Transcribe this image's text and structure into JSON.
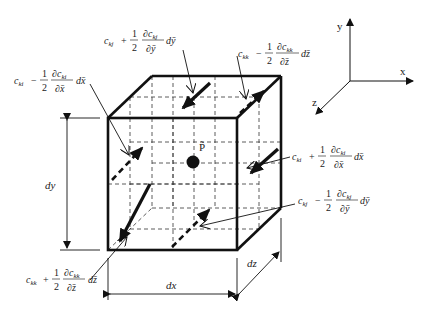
{
  "diagram": {
    "type": "control-volume-cube",
    "center_point": {
      "label": "P̃"
    },
    "axes": {
      "x": "x",
      "y": "y",
      "z": "z"
    },
    "dimensions": {
      "dx": "dx",
      "dy": "dy",
      "dz": "dz"
    },
    "flux_labels": [
      {
        "id": "top",
        "base": "c",
        "sub": "kj",
        "sign": "+",
        "half": "1",
        "den": "2",
        "dnum": "∂c",
        "dnum_sub": "kj",
        "dden": "∂ȳ",
        "diff": "dȳ"
      },
      {
        "id": "back",
        "base": "c",
        "sub": "kk",
        "sign": "−",
        "half": "1",
        "den": "2",
        "dnum": "∂c",
        "dnum_sub": "kk",
        "dden": "∂z̄",
        "diff": "dz̄"
      },
      {
        "id": "left",
        "base": "c",
        "sub": "ki",
        "sign": "−",
        "half": "1",
        "den": "2",
        "dnum": "∂c",
        "dnum_sub": "ki",
        "dden": "∂x̄",
        "diff": "dx̄"
      },
      {
        "id": "right",
        "base": "c",
        "sub": "ki",
        "sign": "+",
        "half": "1",
        "den": "2",
        "dnum": "∂c",
        "dnum_sub": "ki",
        "dden": "∂x̄",
        "diff": "dx̄"
      },
      {
        "id": "bottom",
        "base": "c",
        "sub": "kj",
        "sign": "−",
        "half": "1",
        "den": "2",
        "dnum": "∂c",
        "dnum_sub": "kj",
        "dden": "∂ȳ",
        "diff": "dȳ"
      },
      {
        "id": "front",
        "base": "c",
        "sub": "kk",
        "sign": "+",
        "half": "1",
        "den": "2",
        "dnum": "∂c",
        "dnum_sub": "kk",
        "dden": "∂z̄",
        "diff": "dz̄"
      }
    ],
    "colors": {
      "line": "#111111",
      "dash": "#333333",
      "background": "#ffffff"
    }
  }
}
